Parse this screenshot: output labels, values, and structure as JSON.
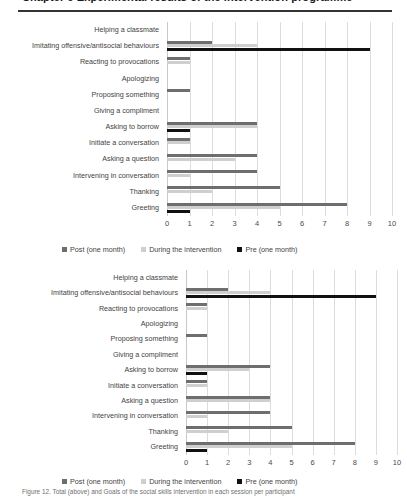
{
  "header": {
    "clipped_heading": "Chapter 9  Experimental results of the intervention programme",
    "caption": "Figure 12. Total (above) and Goals of the social skills intervention in each session per participant"
  },
  "legend": {
    "post_label": "Post (one month)",
    "during_label": "During the intervention",
    "pre_label": "Pre (one month)"
  },
  "colors": {
    "post": "#6e6e6e",
    "during": "#cfcfcf",
    "pre": "#111111",
    "gridline": "#dcdcdc"
  },
  "chart_data": [
    {
      "type": "bar",
      "orientation": "horizontal",
      "title": "",
      "xlabel": "",
      "ylabel": "",
      "xlim": [
        0,
        10
      ],
      "xticks": [
        "0",
        "1",
        "2",
        "3",
        "4",
        "5",
        "6",
        "7",
        "8",
        "9",
        "10"
      ],
      "grid": true,
      "legend_position": "bottom",
      "categories": [
        "Helping a classmate",
        "Imitating offensive/antisocial behaviours",
        "Reacting to provocations",
        "Apologizing",
        "Proposing something",
        "Giving a compliment",
        "Asking to borrow",
        "Initiate a conversation",
        "Asking a question",
        "Intervening in conversation",
        "Thanking",
        "Greeting"
      ],
      "series": [
        {
          "name": "Post (one month)",
          "values": [
            0,
            2,
            1,
            0,
            1,
            0,
            4,
            1,
            4,
            4,
            5,
            8
          ]
        },
        {
          "name": "During the intervention",
          "values": [
            0,
            4,
            1,
            0,
            0,
            0,
            4,
            1,
            3,
            1,
            2,
            5
          ]
        },
        {
          "name": "Pre (one month)",
          "values": [
            0,
            9,
            0,
            0,
            0,
            0,
            1,
            0,
            0,
            0,
            0,
            1
          ]
        }
      ]
    },
    {
      "type": "bar",
      "orientation": "horizontal",
      "title": "",
      "xlabel": "",
      "ylabel": "",
      "xlim": [
        0,
        10
      ],
      "xticks": [
        "0",
        "1",
        "2",
        "3",
        "4",
        "5",
        "6",
        "7",
        "8",
        "9",
        "10"
      ],
      "grid": true,
      "legend_position": "bottom",
      "categories": [
        "Helping a classmate",
        "Imitating offensive/antisocial behaviours",
        "Reacting to provocations",
        "Apologizing",
        "Proposing something",
        "Giving a compliment",
        "Asking to borrow",
        "Initiate a conversation",
        "Asking a question",
        "Intervening in conversation",
        "Thanking",
        "Greeting"
      ],
      "series": [
        {
          "name": "Post (one month)",
          "values": [
            0,
            2,
            1,
            0,
            1,
            0,
            4,
            1,
            4,
            4,
            5,
            8
          ]
        },
        {
          "name": "During the intervention",
          "values": [
            0,
            4,
            1,
            0,
            0,
            0,
            3,
            1,
            4,
            1,
            2,
            5
          ]
        },
        {
          "name": "Pre (one month)",
          "values": [
            0,
            9,
            0,
            0,
            0,
            0,
            1,
            0,
            0,
            0,
            0,
            1
          ]
        }
      ]
    }
  ]
}
